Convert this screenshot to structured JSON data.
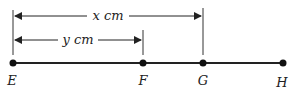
{
  "diagram": {
    "points": [
      {
        "label": "E",
        "x": 13
      },
      {
        "label": "F",
        "x": 143
      },
      {
        "label": "G",
        "x": 203
      },
      {
        "label": "H",
        "x": 283
      }
    ],
    "measurements": [
      {
        "label": "x cm",
        "from": "E",
        "to": "G"
      },
      {
        "label": "y cm",
        "from": "E",
        "to": "F"
      }
    ],
    "colors": {
      "line": "#222222",
      "background": "#ffffff"
    }
  }
}
